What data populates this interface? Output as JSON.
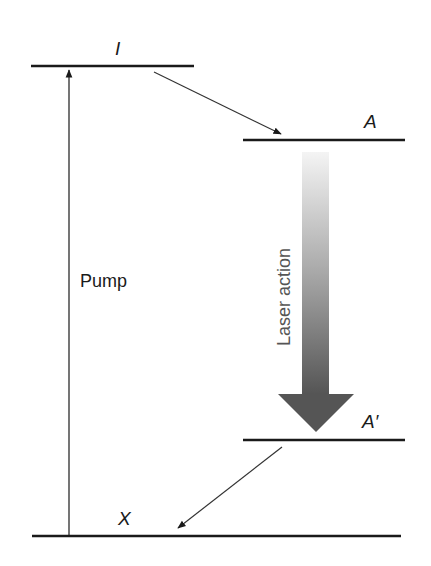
{
  "diagram": {
    "levels": [
      {
        "id": "I",
        "label": "I"
      },
      {
        "id": "A",
        "label": "A"
      },
      {
        "id": "A_prime",
        "label": "A′"
      },
      {
        "id": "X",
        "label": "X"
      }
    ],
    "transitions": {
      "pump": "Pump",
      "laser": "Laser action"
    },
    "colors": {
      "line": "#1a1a1a",
      "arrow_top": "#f2f2f2",
      "arrow_bottom": "#555555"
    }
  }
}
